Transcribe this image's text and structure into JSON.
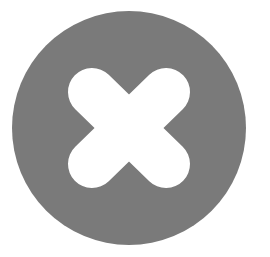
{
  "icon": {
    "semantic": "close-circle-icon",
    "label": "Close",
    "colors": {
      "background": "#ffffff",
      "circle": "#7a7a7a",
      "cross": "#ffffff"
    },
    "geometry": {
      "circle_cx": 129,
      "circle_cy": 128,
      "circle_r": 117,
      "cross_stroke_width": 48,
      "diag1": [
        92,
        92,
        166,
        164
      ],
      "diag2": [
        166,
        92,
        92,
        164
      ]
    }
  }
}
